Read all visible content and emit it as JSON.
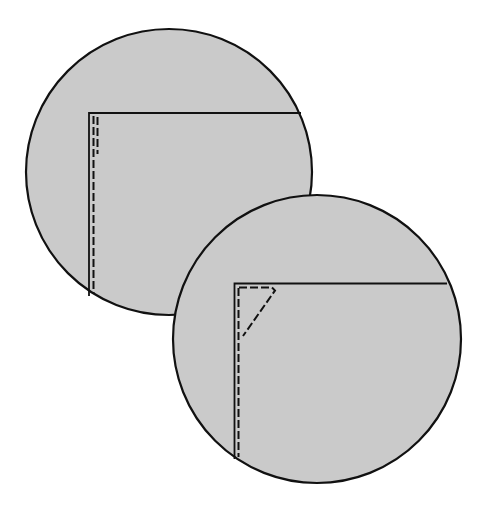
{
  "diagram": {
    "colors": {
      "background": "#ffffff",
      "fill": "#cacaca",
      "stroke": "#111111"
    },
    "views": [
      {
        "id": "detail-view-1",
        "circle": {
          "cx": 169,
          "cy": 172,
          "r": 143
        },
        "edge_solid": {
          "corner_x": 89,
          "corner_y": 113,
          "right_x": 301,
          "bottom_y": 296
        },
        "stitch_dashed_long": {
          "x": 93.5,
          "y1": 116,
          "y2": 294
        },
        "stitch_dashed_short": {
          "x": 97.5,
          "y1": 117,
          "y2": 154
        }
      },
      {
        "id": "detail-view-2",
        "circle": {
          "cx": 317,
          "cy": 339,
          "r": 144
        },
        "edge_solid": {
          "corner_x": 234.5,
          "corner_y": 283.5,
          "right_x": 447,
          "bottom_y": 459
        },
        "stitch_dashed_long": {
          "x": 238.5,
          "y1": 287,
          "y2": 457
        },
        "stitch_dashed_triangle": {
          "points": [
            [
              238.5,
              287.5
            ],
            [
              274,
              287.5
            ],
            [
              276,
              291
            ],
            [
              242,
              335
            ]
          ]
        }
      }
    ]
  }
}
